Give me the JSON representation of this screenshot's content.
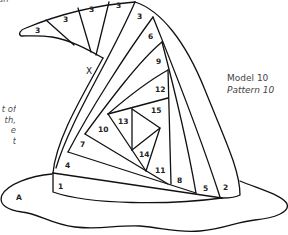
{
  "caption": {
    "model": "Model 10",
    "pattern": "Pattern 10"
  },
  "cropped_text": {
    "top": "an",
    "side": [
      "t of",
      "th,",
      "e",
      "t"
    ]
  },
  "markers": {
    "x": "X",
    "a": "A"
  },
  "segments": [
    {
      "label": "3",
      "x": 37,
      "y": 31
    },
    {
      "label": "3",
      "x": 65,
      "y": 20
    },
    {
      "label": "3",
      "x": 92,
      "y": 10
    },
    {
      "label": "3",
      "x": 118,
      "y": 6
    },
    {
      "label": "3",
      "x": 139,
      "y": 17
    },
    {
      "label": "6",
      "x": 150,
      "y": 37
    },
    {
      "label": "9",
      "x": 158,
      "y": 62
    },
    {
      "label": "12",
      "x": 158,
      "y": 90
    },
    {
      "label": "15",
      "x": 154,
      "y": 112
    },
    {
      "label": "13",
      "x": 122,
      "y": 124
    },
    {
      "label": "10",
      "x": 101,
      "y": 131
    },
    {
      "label": "7",
      "x": 82,
      "y": 146
    },
    {
      "label": "14",
      "x": 142,
      "y": 156
    },
    {
      "label": "11",
      "x": 158,
      "y": 172
    },
    {
      "label": "4",
      "x": 67,
      "y": 167
    },
    {
      "label": "8",
      "x": 179,
      "y": 182
    },
    {
      "label": "5",
      "x": 205,
      "y": 190
    },
    {
      "label": "2",
      "x": 225,
      "y": 189
    },
    {
      "label": "1",
      "x": 60,
      "y": 188
    }
  ],
  "colors": {
    "line": "#111111",
    "background": "#ffffff",
    "text": "#444444"
  }
}
